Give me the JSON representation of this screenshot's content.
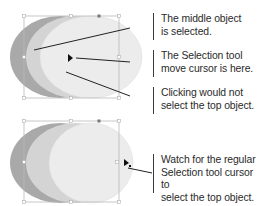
{
  "figure": {
    "top_diagram": {
      "description": "Three overlapping ellipses; middle object selected with bounding box",
      "colors": {
        "back_ellipse": "#a9a9a9",
        "middle_ellipse": "#d4d4d4",
        "top_ellipse": "#ececec",
        "bounding_box": "#b9b9b9",
        "leader_line": "#222222"
      }
    },
    "bottom_diagram": {
      "description": "Same three ellipses; cursor at right edge of top ellipse showing regular Selection tool cursor"
    },
    "callouts": [
      {
        "id": "middle-selected",
        "text": "The middle object\nis selected."
      },
      {
        "id": "move-cursor",
        "text": "The Selection tool\nmove cursor is here."
      },
      {
        "id": "would-not-select",
        "text": "Clicking would not\nselect the top object."
      },
      {
        "id": "watch-cursor",
        "text": "Watch for the regular\nSelection tool cursor to\nselect the top object."
      }
    ],
    "icons": {
      "move_cursor": "arrow-pointer-icon",
      "selection_cursor": "arrow-pointer-with-square-icon"
    }
  }
}
